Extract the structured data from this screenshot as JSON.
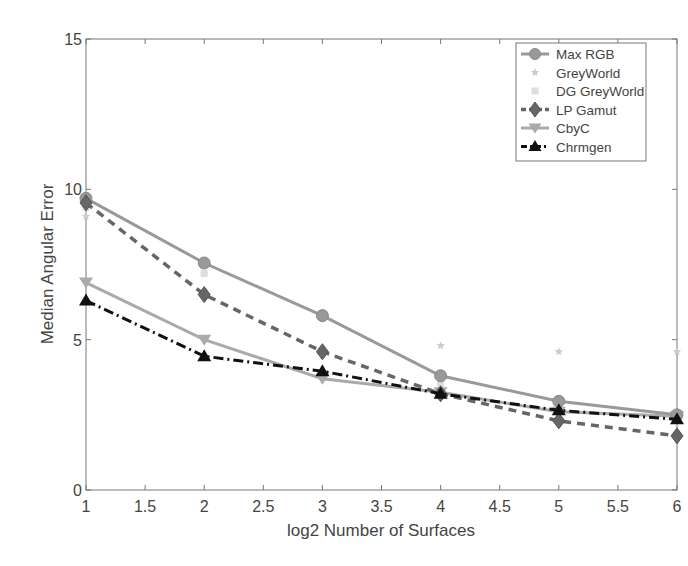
{
  "chart_data": {
    "type": "line",
    "title": "",
    "xlabel": "log2 Number of Surfaces",
    "ylabel": "Median Angular Error",
    "xlim": [
      1,
      6
    ],
    "ylim": [
      0,
      15
    ],
    "grid": false,
    "legend_position": "upper right",
    "x": [
      1,
      2,
      3,
      4,
      5,
      6
    ],
    "xticks": [
      "1",
      "1.5",
      "2",
      "2.5",
      "3",
      "3.5",
      "4",
      "4.5",
      "5",
      "5.5",
      "6"
    ],
    "yticks": [
      "0",
      "5",
      "10",
      "15"
    ],
    "series": [
      {
        "name": "Max RGB",
        "values": [
          9.7,
          7.55,
          5.8,
          3.8,
          2.95,
          2.5
        ],
        "color": "#999999",
        "style": "solid",
        "marker": "circle"
      },
      {
        "name": "GreyWorld",
        "values": [
          9.1,
          7.2,
          5.7,
          4.8,
          4.6,
          4.6
        ],
        "color": "#cccccc",
        "style": "none",
        "marker": "star"
      },
      {
        "name": "DG GreyWorld",
        "values": [
          9.4,
          7.2,
          5.75,
          3.55,
          2.8,
          2.4
        ],
        "color": "#dddddd",
        "style": "none",
        "marker": "square"
      },
      {
        "name": "LP Gamut",
        "values": [
          9.55,
          6.5,
          4.6,
          3.2,
          2.3,
          1.8
        ],
        "color": "#666666",
        "style": "dashed",
        "marker": "diamond"
      },
      {
        "name": "CbyC",
        "values": [
          6.9,
          5.0,
          3.7,
          3.25,
          2.6,
          2.45
        ],
        "color": "#aaaaaa",
        "style": "solid",
        "marker": "triangle-down"
      },
      {
        "name": "Chrmgen",
        "values": [
          6.3,
          4.45,
          3.95,
          3.2,
          2.65,
          2.35
        ],
        "color": "#111111",
        "style": "dashdot",
        "marker": "triangle-up"
      }
    ]
  }
}
